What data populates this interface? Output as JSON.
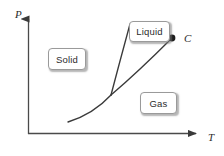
{
  "figure": {
    "kind": "phase-diagram",
    "background_color": "#ffffff",
    "line_color": "#3a3a3a",
    "box_border_color": "#9a9a9a",
    "text_color": "#2b2b2b"
  },
  "axes": {
    "y_label": "P",
    "x_label": "T",
    "origin": {
      "x": 28,
      "y": 134
    },
    "y_top": {
      "x": 28,
      "y": 14
    },
    "x_right": {
      "x": 202,
      "y": 134
    },
    "arrowheads": true,
    "ticks": [],
    "tick_labels": []
  },
  "regions": [
    {
      "id": "solid",
      "label": "Solid",
      "x": 48,
      "y": 48,
      "w": 38,
      "h": 22
    },
    {
      "id": "liquid",
      "label": "Liquid",
      "x": 129,
      "y": 21,
      "w": 41,
      "h": 21
    },
    {
      "id": "gas",
      "label": "Gas",
      "x": 140,
      "y": 92,
      "w": 37,
      "h": 22
    }
  ],
  "points": [
    {
      "id": "critical-point",
      "label": "C",
      "x": 172,
      "y": 38,
      "radius": 3.4
    }
  ],
  "curves": [
    {
      "id": "sublimation-curve",
      "name": "solid-gas boundary",
      "path": "M 68 122 C 84 117 99 108 111 95"
    },
    {
      "id": "fusion-curve",
      "name": "solid-liquid boundary",
      "path": "M 111 95 C 117 72 124 46 130 24"
    },
    {
      "id": "vaporization-curve",
      "name": "liquid-gas boundary",
      "path": "M 111 95 C 131 78 154 56 172 38"
    }
  ],
  "chart_data": {
    "type": "line",
    "title": "",
    "xlabel": "T",
    "ylabel": "P",
    "grid": false,
    "legend": "none",
    "annotations": [
      "Solid",
      "Liquid",
      "Gas",
      "C"
    ],
    "series": [
      {
        "name": "sublimation-curve",
        "x": [
          68,
          84,
          99,
          111
        ],
        "y": [
          122,
          117,
          108,
          95
        ]
      },
      {
        "name": "fusion-curve",
        "x": [
          111,
          117,
          124,
          130
        ],
        "y": [
          95,
          72,
          46,
          24
        ]
      },
      {
        "name": "vaporization-curve",
        "x": [
          111,
          131,
          154,
          172
        ],
        "y": [
          95,
          78,
          56,
          38
        ]
      }
    ],
    "markers": [
      {
        "name": "C",
        "x": 172,
        "y": 38
      }
    ]
  }
}
